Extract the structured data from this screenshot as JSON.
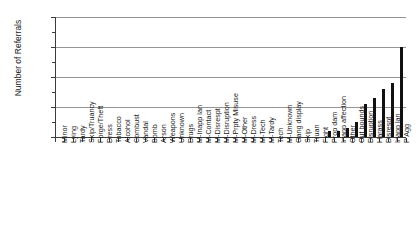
{
  "chart_data": {
    "type": "bar",
    "title": "",
    "xlabel": "",
    "ylabel": "Number of Referrals",
    "ylim": [
      0,
      40
    ],
    "yticks": [
      0,
      10,
      20,
      30,
      40
    ],
    "ytick_labels": [
      "0",
      "10",
      "20",
      "30",
      "40"
    ],
    "minor_yticks": [
      5,
      15,
      25,
      35
    ],
    "grid": "horizontal",
    "legend": "none",
    "orientation": "vertical",
    "bar_color": "#111111",
    "grid_color": "#959595",
    "axis_color": "#3c3c3c",
    "categories": [
      "Minor",
      "Lying",
      "Tardy",
      "Skip/Truancy",
      "Forge/Theft",
      "Dress",
      "Tobacco",
      "Alcohol",
      "Combust",
      "Vandal",
      "Bomb",
      "Arson",
      "Weapons",
      "Unknown",
      "Drugs",
      "M-Inapp lan",
      "M-Contact",
      "M-Disrespt",
      "M-Disruption",
      "M-Prpty Misuse",
      "M-Other",
      "M-Dress",
      "M-Tech",
      "M-Tardy",
      "Tech",
      "M-Unknown",
      "Gang display",
      "Skip",
      "Truan",
      "Fight",
      "Prop dam",
      "Inapp affection",
      "Other",
      "Out bounds",
      "Disruption",
      "Harass",
      "Disrespt",
      "Inapp lan",
      "P Agg"
    ],
    "values": [
      0,
      0,
      0,
      0,
      0,
      0,
      0,
      0,
      0,
      0,
      0,
      0,
      0,
      0,
      0,
      0,
      0,
      0,
      0,
      0,
      0,
      0,
      0,
      0,
      0,
      0,
      0,
      0,
      0,
      0,
      2,
      2,
      3,
      5,
      11,
      13,
      16,
      18,
      30
    ]
  }
}
